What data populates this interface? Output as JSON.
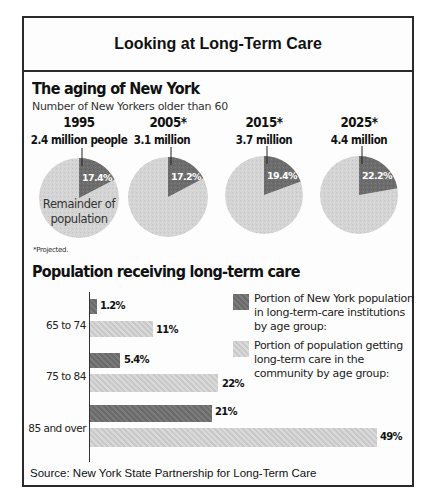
{
  "title": "Looking at Long-Term Care",
  "aging": {
    "title": "The aging of New York",
    "subtitle": "Number of New Yorkers older than 60",
    "remainder_label_1": "Remainder of",
    "remainder_label_2": "population",
    "footnote": "*Projected.",
    "pies": [
      {
        "year": "1995",
        "population": "2.4 million people",
        "share_label": "17.4%",
        "share": 17.4
      },
      {
        "year": "2005*",
        "population": "3.1 million",
        "share_label": "17.2%",
        "share": 17.2
      },
      {
        "year": "2015*",
        "population": "3.7 million",
        "share_label": "19.4%",
        "share": 19.4
      },
      {
        "year": "2025*",
        "population": "4.4 million",
        "share_label": "22.2%",
        "share": 22.2
      }
    ]
  },
  "care": {
    "title": "Population receiving long-term care",
    "categories": [
      "65 to 74",
      "75 to 84",
      "85 and over"
    ],
    "institution_labels": [
      "1.2%",
      "5.4%",
      "21%"
    ],
    "community_labels": [
      "11%",
      "22%",
      "49%"
    ],
    "legend": {
      "institutions": "Portion of New York population in long-term-care institutions by age group:",
      "community": "Portion of population getting long-term care in the community by age group:"
    }
  },
  "source": "Source:  New York State Partnership for Long-Term Care",
  "colors": {
    "dark_slice": "#6b6b6b",
    "light_slice": "#d2d2d2",
    "border": "#2a2a2a"
  },
  "chart_data": [
    {
      "type": "pie",
      "title": "The aging of New York",
      "subtitle": "Number of New Yorkers older than 60",
      "categories": [
        "1995",
        "2005*",
        "2015*",
        "2025*"
      ],
      "totals_label": [
        "2.4 million people",
        "3.1 million",
        "3.7 million",
        "4.4 million"
      ],
      "totals_millions": [
        2.4,
        3.1,
        3.7,
        4.4
      ],
      "series": [
        {
          "name": "Older than 60 (share of population, %)",
          "values": [
            17.4,
            17.2,
            19.4,
            22.2
          ]
        },
        {
          "name": "Remainder of population (%)",
          "values": [
            82.6,
            82.8,
            80.6,
            77.8
          ]
        }
      ],
      "annotations": [
        "*Projected."
      ]
    },
    {
      "type": "bar",
      "orientation": "horizontal",
      "title": "Population receiving long-term care",
      "categories": [
        "65 to 74",
        "75 to 84",
        "85 and over"
      ],
      "series": [
        {
          "name": "Portion of New York population in long-term-care institutions by age group",
          "values": [
            1.2,
            5.4,
            21
          ]
        },
        {
          "name": "Portion of population getting long-term care in the community by age group",
          "values": [
            11,
            22,
            49
          ]
        }
      ],
      "xlabel": "",
      "ylabel": "",
      "unit": "%",
      "grid": false,
      "legend_position": "right"
    }
  ]
}
